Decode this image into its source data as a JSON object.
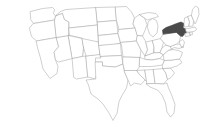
{
  "figure": {
    "type": "choropleth-locator-map",
    "title": "Map of the United States with New York highlighted",
    "region": "United States (contiguous 48 states)",
    "background_color": "#ffffff",
    "border_color": "#a9a9a9",
    "state_fill_color": "#ffffff",
    "highlight_fill_color": "#4a4a4a",
    "highlight_stroke_color": "#3a3a3a",
    "highlighted_states": [
      "New York"
    ],
    "width": 201,
    "height": 131,
    "has_labels": false,
    "has_legend": false,
    "has_border": false
  },
  "states": [
    {
      "code": "WA",
      "name": "Washington",
      "highlighted": false
    },
    {
      "code": "OR",
      "name": "Oregon",
      "highlighted": false
    },
    {
      "code": "CA",
      "name": "California",
      "highlighted": false
    },
    {
      "code": "NV",
      "name": "Nevada",
      "highlighted": false
    },
    {
      "code": "ID",
      "name": "Idaho",
      "highlighted": false
    },
    {
      "code": "MT",
      "name": "Montana",
      "highlighted": false
    },
    {
      "code": "WY",
      "name": "Wyoming",
      "highlighted": false
    },
    {
      "code": "UT",
      "name": "Utah",
      "highlighted": false
    },
    {
      "code": "AZ",
      "name": "Arizona",
      "highlighted": false
    },
    {
      "code": "NM",
      "name": "New Mexico",
      "highlighted": false
    },
    {
      "code": "CO",
      "name": "Colorado",
      "highlighted": false
    },
    {
      "code": "ND",
      "name": "North Dakota",
      "highlighted": false
    },
    {
      "code": "SD",
      "name": "South Dakota",
      "highlighted": false
    },
    {
      "code": "NE",
      "name": "Nebraska",
      "highlighted": false
    },
    {
      "code": "KS",
      "name": "Kansas",
      "highlighted": false
    },
    {
      "code": "OK",
      "name": "Oklahoma",
      "highlighted": false
    },
    {
      "code": "TX",
      "name": "Texas",
      "highlighted": false
    },
    {
      "code": "MN",
      "name": "Minnesota",
      "highlighted": false
    },
    {
      "code": "IA",
      "name": "Iowa",
      "highlighted": false
    },
    {
      "code": "MO",
      "name": "Missouri",
      "highlighted": false
    },
    {
      "code": "AR",
      "name": "Arkansas",
      "highlighted": false
    },
    {
      "code": "LA",
      "name": "Louisiana",
      "highlighted": false
    },
    {
      "code": "WI",
      "name": "Wisconsin",
      "highlighted": false
    },
    {
      "code": "IL",
      "name": "Illinois",
      "highlighted": false
    },
    {
      "code": "MI",
      "name": "Michigan",
      "highlighted": false
    },
    {
      "code": "IN",
      "name": "Indiana",
      "highlighted": false
    },
    {
      "code": "OH",
      "name": "Ohio",
      "highlighted": false
    },
    {
      "code": "KY",
      "name": "Kentucky",
      "highlighted": false
    },
    {
      "code": "TN",
      "name": "Tennessee",
      "highlighted": false
    },
    {
      "code": "MS",
      "name": "Mississippi",
      "highlighted": false
    },
    {
      "code": "AL",
      "name": "Alabama",
      "highlighted": false
    },
    {
      "code": "GA",
      "name": "Georgia",
      "highlighted": false
    },
    {
      "code": "FL",
      "name": "Florida",
      "highlighted": false
    },
    {
      "code": "SC",
      "name": "South Carolina",
      "highlighted": false
    },
    {
      "code": "NC",
      "name": "North Carolina",
      "highlighted": false
    },
    {
      "code": "VA",
      "name": "Virginia",
      "highlighted": false
    },
    {
      "code": "WV",
      "name": "West Virginia",
      "highlighted": false
    },
    {
      "code": "MD",
      "name": "Maryland",
      "highlighted": false
    },
    {
      "code": "DE",
      "name": "Delaware",
      "highlighted": false
    },
    {
      "code": "PA",
      "name": "Pennsylvania",
      "highlighted": false
    },
    {
      "code": "NJ",
      "name": "New Jersey",
      "highlighted": false
    },
    {
      "code": "NY",
      "name": "New York",
      "highlighted": true
    },
    {
      "code": "CT",
      "name": "Connecticut",
      "highlighted": false
    },
    {
      "code": "RI",
      "name": "Rhode Island",
      "highlighted": false
    },
    {
      "code": "MA",
      "name": "Massachusetts",
      "highlighted": false
    },
    {
      "code": "VT",
      "name": "Vermont",
      "highlighted": false
    },
    {
      "code": "NH",
      "name": "New Hampshire",
      "highlighted": false
    },
    {
      "code": "ME",
      "name": "Maine",
      "highlighted": false
    }
  ]
}
